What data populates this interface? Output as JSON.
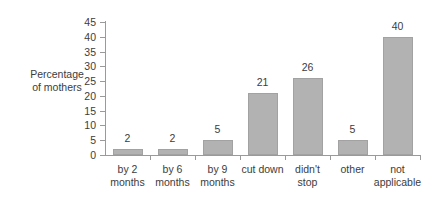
{
  "chart_data": {
    "type": "bar",
    "title": "",
    "xlabel": "",
    "ylabel": "Percentage of mothers",
    "ylabel_lines": [
      "Percentage",
      "of mothers"
    ],
    "categories": [
      "by 2 months",
      "by 6 months",
      "by 9 months",
      "cut down",
      "didn't stop",
      "other",
      "not applicable"
    ],
    "category_lines": [
      [
        "by 2",
        "months"
      ],
      [
        "by 6",
        "months"
      ],
      [
        "by 9",
        "months"
      ],
      [
        "cut down",
        ""
      ],
      [
        "didn't",
        "stop"
      ],
      [
        "other",
        ""
      ],
      [
        "not",
        "applicable"
      ]
    ],
    "values": [
      2,
      2,
      5,
      21,
      26,
      5,
      40
    ],
    "value_labels": [
      "2",
      "2",
      "5",
      "21",
      "26",
      "5",
      "40"
    ],
    "ylim": [
      0,
      45
    ],
    "ytick_labels": [
      "0",
      "5",
      "10",
      "15",
      "20",
      "25",
      "30",
      "35",
      "40",
      "45"
    ],
    "ytick_values": [
      0,
      5,
      10,
      15,
      20,
      25,
      30,
      35,
      40,
      45
    ],
    "grid": false,
    "legend": null,
    "bar_color": "#b2b2b2",
    "axis_color": "#9a9a9a",
    "text_color": "#3c3c3c"
  }
}
